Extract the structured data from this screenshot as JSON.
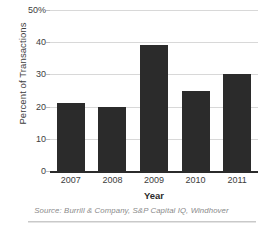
{
  "chart_data": {
    "type": "bar",
    "title": "",
    "subtitle": "",
    "categories": [
      "2007",
      "2008",
      "2009",
      "2010",
      "2011"
    ],
    "values": [
      21,
      20,
      39,
      25,
      30
    ],
    "series": [
      {
        "name": "Percent of Transactions",
        "values": [
          21,
          20,
          39,
          25,
          30
        ]
      }
    ],
    "xlabel": "Year",
    "ylabel": "Percent of Transactions",
    "ylim": [
      0,
      50
    ],
    "ytick_values": [
      0,
      10,
      20,
      30,
      40,
      50
    ],
    "ytick_labels": [
      "0",
      "10",
      "20",
      "30",
      "40",
      "50%"
    ],
    "grid": true,
    "legend": "none",
    "bar_color": "#2b2b2b",
    "gridline_color": "#d8d8d8",
    "axis_color": "#2b2b2b",
    "source_note": "Source: Burrill & Company, S&P Capital IQ, Windhover"
  }
}
